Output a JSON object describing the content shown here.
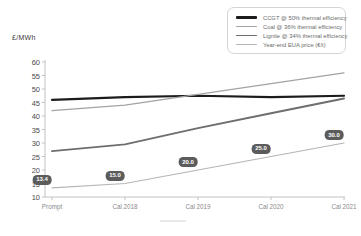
{
  "chart_data": {
    "type": "line",
    "title": "",
    "ylabel": "£/MWh",
    "xlabel": "",
    "categories": [
      "Prompt",
      "Cal 2018",
      "Cal 2019",
      "Cal 2020",
      "Cal 2021"
    ],
    "ylim": [
      10,
      60
    ],
    "yticks": [
      60,
      55,
      50,
      45,
      40,
      35,
      30,
      25,
      20,
      15,
      10
    ],
    "grid": false,
    "legend_position": "top-right",
    "series": [
      {
        "name": "CCGT @ 50% thermal efficiency",
        "values": [
          46,
          47,
          47.5,
          47,
          47.5
        ],
        "color": "#1c1c1c",
        "width": 2.2
      },
      {
        "name": "Coal @ 36% thermal efficiency",
        "values": [
          42,
          44,
          48,
          52,
          56
        ],
        "color": "#a3a3a3",
        "width": 1.2
      },
      {
        "name": "Lignite @ 34% thermal efficiency",
        "values": [
          27,
          29.5,
          35.5,
          41,
          46.5
        ],
        "color": "#6e6e6e",
        "width": 1.9
      },
      {
        "name": "Year-end EUA price (€/t)",
        "values": [
          13.4,
          15,
          20,
          25,
          30
        ],
        "color": "#b5b5b5",
        "width": 1.2,
        "point_labels": [
          "13.4",
          "15.0",
          "20.0",
          "25.0",
          "30.0"
        ]
      }
    ],
    "point_label_style": {
      "bg": "#5c5c5c",
      "fg": "#ffffff"
    },
    "axis_color": "#c2c2c2"
  }
}
